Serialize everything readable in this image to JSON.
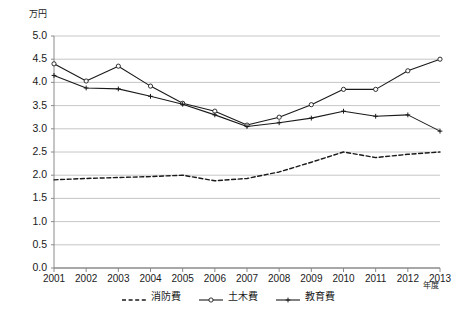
{
  "chart_data": {
    "type": "line",
    "title": "",
    "subtitle": "",
    "xlabel": "年度",
    "ylabel": "万円",
    "unit_label": "万円",
    "x": [
      "2001",
      "2002",
      "2003",
      "2004",
      "2005",
      "2006",
      "2007",
      "2008",
      "2009",
      "2010",
      "2011",
      "2012",
      "2013"
    ],
    "categories": [
      "2001",
      "2002",
      "2003",
      "2004",
      "2005",
      "2006",
      "2007",
      "2008",
      "2009",
      "2010",
      "2011",
      "2012",
      "2013"
    ],
    "ylim": [
      0.0,
      5.0
    ],
    "ytick_labels": [
      "0.0",
      "0.5",
      "1.0",
      "1.5",
      "2.0",
      "2.5",
      "3.0",
      "3.5",
      "4.0",
      "4.5",
      "5.0"
    ],
    "ytick_values": [
      0.0,
      0.5,
      1.0,
      1.5,
      2.0,
      2.5,
      3.0,
      3.5,
      4.0,
      4.5,
      5.0
    ],
    "grid": true,
    "grid_axis": "y",
    "legend_position": "bottom",
    "series": [
      {
        "name": "消防費",
        "style": "dashed",
        "marker": "none",
        "color": "#1a1a1a",
        "values": [
          1.9,
          1.93,
          1.95,
          1.97,
          2.0,
          1.88,
          1.93,
          2.07,
          2.28,
          2.5,
          2.38,
          2.45,
          2.5
        ]
      },
      {
        "name": "土木費",
        "style": "solid",
        "marker": "circle",
        "color": "#1a1a1a",
        "values": [
          4.4,
          4.03,
          4.35,
          3.92,
          3.55,
          3.38,
          3.08,
          3.25,
          3.52,
          3.85,
          3.85,
          4.25,
          4.5
        ]
      },
      {
        "name": "教育費",
        "style": "solid",
        "marker": "plus",
        "color": "#1a1a1a",
        "values": [
          4.15,
          3.88,
          3.86,
          3.7,
          3.53,
          3.3,
          3.05,
          3.13,
          3.23,
          3.38,
          3.27,
          3.3,
          2.95
        ]
      }
    ],
    "legend": [
      {
        "label": "消防費",
        "style": "dashed",
        "marker": "none"
      },
      {
        "label": "土木費",
        "style": "solid",
        "marker": "circle"
      },
      {
        "label": "教育費",
        "style": "solid",
        "marker": "plus"
      }
    ],
    "colors": {
      "line": "#1a1a1a",
      "grid": "#b8b8b8",
      "axis": "#8a8a8a",
      "background": "#ffffff",
      "marker_fill": "#ffffff"
    }
  }
}
